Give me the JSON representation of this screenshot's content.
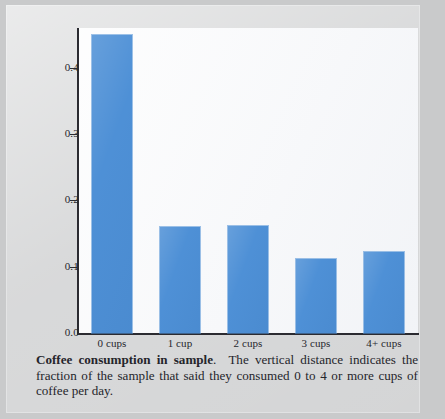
{
  "figure": {
    "caption_title": "Coffee consumption in sample",
    "caption_title_separator": ".",
    "caption_body": "The vertical distance indicates the fraction of the sample that said they consumed 0 to 4 or more cups of coffee per day."
  },
  "colors": {
    "bar": "#4e90d6",
    "axis": "#2b2b31",
    "plot_background": "#f7f8fa",
    "page_background": "#c9cacb",
    "text": "#25252b"
  },
  "chart_data": {
    "type": "bar",
    "title": "Coffee consumption in sample",
    "xlabel": "",
    "ylabel": "",
    "categories": [
      "0 cups",
      "1 cup",
      "2 cups",
      "3 cups",
      "4+ cups"
    ],
    "values": [
      0.45,
      0.16,
      0.162,
      0.112,
      0.122
    ],
    "ylim": [
      0.0,
      0.46
    ],
    "yticks": [
      0.0,
      0.1,
      0.2,
      0.3,
      0.4
    ],
    "ytick_labels": [
      "0.0",
      "0.1",
      "0.2",
      "0.3",
      "0.4"
    ],
    "grid": false,
    "legend": null,
    "series": [
      {
        "name": "fraction of sample",
        "values": [
          0.45,
          0.16,
          0.162,
          0.112,
          0.122
        ]
      }
    ]
  }
}
